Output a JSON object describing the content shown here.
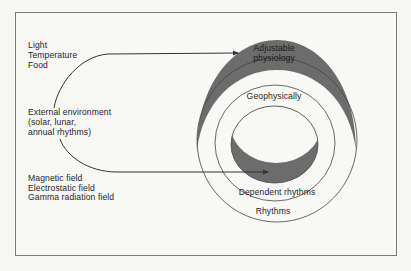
{
  "diagram": {
    "type": "concentric-rings",
    "colors": {
      "background": "#f8f8f6",
      "frame": "#7a7a7a",
      "line": "#333333",
      "dark_fill": "#6c6c6c"
    },
    "left_groups": {
      "top_factors": [
        "Light",
        "Temperature",
        "Food"
      ],
      "external_environment": [
        "External environment",
        "(solar, lunar,",
        "annual rhythms)"
      ],
      "bottom_factors": [
        "Magnetic field",
        "Electrostatic field",
        "Gamma radiation field"
      ]
    },
    "rings": {
      "outer_dark_band": [
        "Adjustable",
        "physiology"
      ],
      "middle_ring_label": "Geophysically",
      "inner_dark_band_label": "Dependent rhythms",
      "outer_ring_label": "Rhythms"
    },
    "arrows": [
      {
        "from": "top_factors",
        "to": "outer_dark_band"
      },
      {
        "from": "bottom_factors",
        "to": "inner_dark_band"
      }
    ]
  }
}
